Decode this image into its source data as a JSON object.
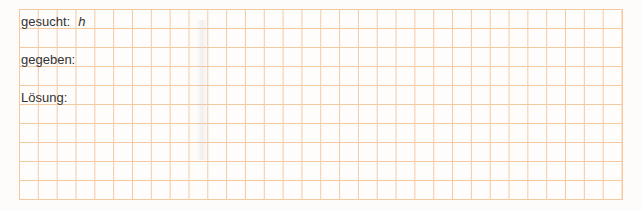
{
  "worksheet": {
    "rows": [
      {
        "label": "gesucht:",
        "value": "h"
      },
      {
        "label": "gegeben:",
        "value": ""
      },
      {
        "label": "Lösung:",
        "value": ""
      }
    ],
    "grid": {
      "columns": 32,
      "rows": 10,
      "line_color": "#f3c9a2"
    }
  }
}
